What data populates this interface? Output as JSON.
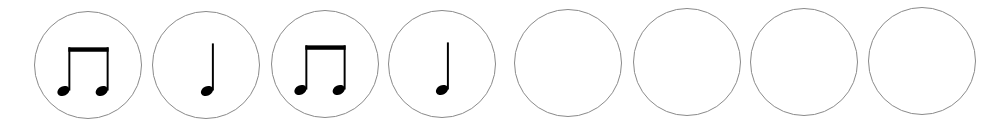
{
  "rhythm": {
    "slots": [
      {
        "index": 1,
        "note": "eighth-note-pair",
        "filled": true
      },
      {
        "index": 2,
        "note": "quarter-note",
        "filled": true
      },
      {
        "index": 3,
        "note": "eighth-note-pair",
        "filled": true
      },
      {
        "index": 4,
        "note": "quarter-note",
        "filled": true
      },
      {
        "index": 5,
        "note": "",
        "filled": false
      },
      {
        "index": 6,
        "note": "",
        "filled": false
      },
      {
        "index": 7,
        "note": "",
        "filled": false
      },
      {
        "index": 8,
        "note": "",
        "filled": false
      }
    ]
  },
  "colors": {
    "circle_border": "#8a8a8a",
    "note_fill": "#000000",
    "background": "#ffffff"
  }
}
